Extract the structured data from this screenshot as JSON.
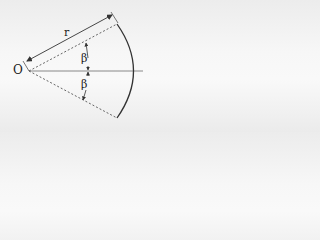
{
  "diagram": {
    "type": "circular-sector",
    "labels": {
      "origin": "O",
      "radius": "r",
      "upper_half_angle": "β",
      "lower_half_angle": "β"
    },
    "colors": {
      "stroke": "#333333",
      "dashed": "#555555",
      "axis": "#888888",
      "text": "#222222"
    },
    "geometry": {
      "origin": [
        29,
        71
      ],
      "upper_edge_end": [
        117,
        24
      ],
      "lower_edge_end": [
        117,
        118
      ],
      "arc_apex": [
        138,
        71
      ],
      "axis_end": [
        143,
        71
      ]
    }
  }
}
